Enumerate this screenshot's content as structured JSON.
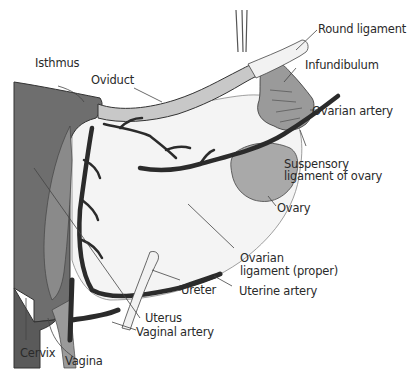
{
  "figure": {
    "type": "anatomical-illustration",
    "labels": {
      "round_ligament": "Round ligament",
      "infundibulum": "Infundibulum",
      "isthmus": "Isthmus",
      "oviduct": "Oviduct",
      "ovarian_artery": "Ovarian artery",
      "suspensory_1": "Suspensory",
      "suspensory_2": "ligament of ovary",
      "ovary": "Ovary",
      "ovarian_ligament_1": "Ovarian",
      "ovarian_ligament_2": "ligament (proper)",
      "ureter": "Ureter",
      "uterine_artery": "Uterine artery",
      "uterus": "Uterus",
      "vaginal_artery": "Vaginal artery",
      "cervix": "Cervix",
      "vagina": "Vagina"
    },
    "colors": {
      "uterus_wall": "#6e6e6e",
      "uterus_inner": "#8a8a8a",
      "oviduct": "#c8c8c8",
      "ovary": "#a9a9a9",
      "artery": "#2b2b2b",
      "ligament": "#f2f2f2",
      "text": "#2a2a2a"
    }
  }
}
